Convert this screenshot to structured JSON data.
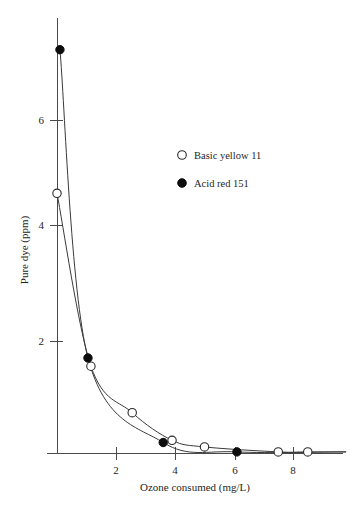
{
  "chart_data": {
    "type": "scatter",
    "title": "",
    "xlabel": "Ozone consumed (mg/L)",
    "ylabel": "Pure dye (ppm)",
    "xlim": [
      0,
      9.8
    ],
    "ylim": [
      0,
      7.8
    ],
    "xticks": [
      2,
      4,
      6,
      8
    ],
    "yticks": [
      2,
      4,
      6
    ],
    "xtick_labels": [
      "2",
      "4",
      "6",
      "8"
    ],
    "ytick_labels": [
      "2",
      "4",
      "6"
    ],
    "grid": false,
    "legend_position": "center-right-upper",
    "series": [
      {
        "name": "Basic yellow 11",
        "marker": "open-circle",
        "color": "#ffffff",
        "edge_color": "#2a2a2a",
        "points": [
          {
            "x": 0.0,
            "y": 4.7
          },
          {
            "x": 1.15,
            "y": 1.57
          },
          {
            "x": 2.55,
            "y": 0.73
          },
          {
            "x": 3.9,
            "y": 0.23
          },
          {
            "x": 5.0,
            "y": 0.11
          },
          {
            "x": 7.5,
            "y": 0.02
          },
          {
            "x": 8.5,
            "y": 0.02
          }
        ]
      },
      {
        "name": "Acid red 151",
        "marker": "filled-circle",
        "color": "#0d0d0d",
        "edge_color": "#0d0d0d",
        "points": [
          {
            "x": 0.1,
            "y": 7.3
          },
          {
            "x": 1.05,
            "y": 1.72
          },
          {
            "x": 3.6,
            "y": 0.19
          },
          {
            "x": 6.1,
            "y": 0.02
          }
        ]
      }
    ]
  },
  "axes": {
    "y_title": "Pure dye (ppm)",
    "x_title": "Ozone consumed (mg/L)",
    "y_tick_labels": [
      "6",
      "4",
      "2"
    ],
    "x_tick_labels": [
      "2",
      "4",
      "6",
      "8"
    ]
  },
  "legend": {
    "entries": [
      {
        "label": "Basic yellow 11",
        "marker": "open-circle-marker"
      },
      {
        "label": "Acid red 151",
        "marker": "filled-circle-marker"
      }
    ]
  },
  "colors": {
    "axis": "#4a4a4a",
    "curve": "#3a3a3a",
    "filled_marker": "#0d0d0d",
    "open_marker_fill": "#ffffff",
    "open_marker_edge": "#2a2a2a",
    "background": "#ffffff",
    "text": "#1f1f1f"
  }
}
